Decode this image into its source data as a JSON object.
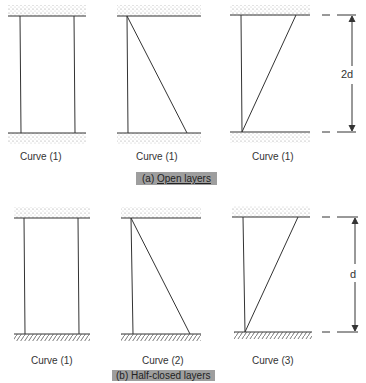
{
  "sections": [
    {
      "caption_prefix": "(a)",
      "caption_text": "Open layers",
      "boundary_bottom": "sand",
      "panels": [
        {
          "label": "Curve (1)",
          "profile": "uniform"
        },
        {
          "label": "Curve (1)",
          "profile": "decreasing-to-bottom"
        },
        {
          "label": "Curve (1)",
          "profile": "increasing-to-top"
        }
      ],
      "dimension": "2d"
    },
    {
      "caption_prefix": "(b)",
      "caption_text": "Half-closed layers",
      "boundary_bottom": "impermeable-hatched",
      "panels": [
        {
          "label": "Curve (1)",
          "profile": "uniform"
        },
        {
          "label": "Curve (2)",
          "profile": "decreasing-to-bottom"
        },
        {
          "label": "Curve (3)",
          "profile": "increasing-to-top"
        }
      ],
      "dimension": "d"
    }
  ]
}
